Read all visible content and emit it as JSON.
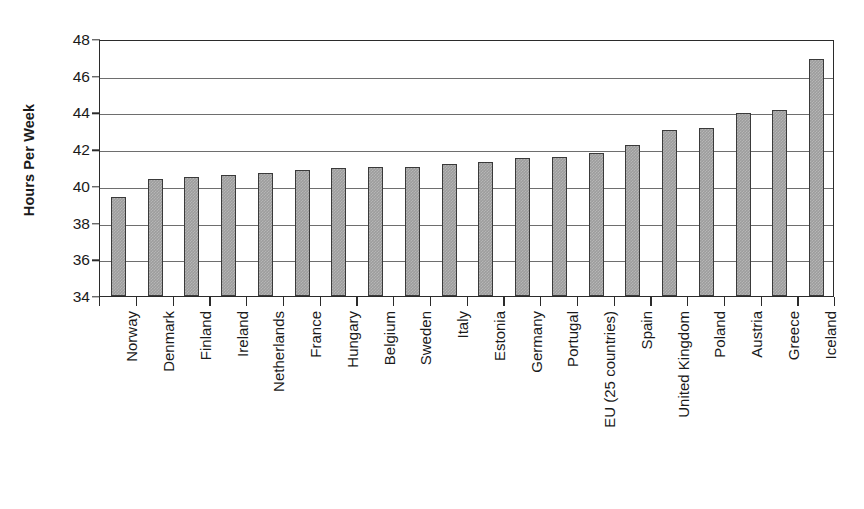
{
  "chart_data": {
    "type": "bar",
    "title": "",
    "subtitle": "",
    "xlabel": "",
    "ylabel": "Hours Per Week",
    "ylim": [
      34,
      48
    ],
    "ytick_step": 2,
    "yticks": [
      34,
      36,
      38,
      40,
      42,
      44,
      46,
      48
    ],
    "grid": true,
    "legend": false,
    "legend_position": "none",
    "orientation": "vertical",
    "bar_color": "#9d9d9d",
    "bar_border_color": "#3a3a3a",
    "gridline_color": "#6e6e6e",
    "axis_color": "#2b2b2b",
    "background": "#ffffff",
    "categories": [
      "Norway",
      "Denmark",
      "Finland",
      "Ireland",
      "Netherlands",
      "France",
      "Hungary",
      "Belgium",
      "Sweden",
      "Italy",
      "Estonia",
      "Germany",
      "Portugal",
      "EU (25 countries)",
      "Spain",
      "United Kingdom",
      "Poland",
      "Austria",
      "Greece",
      "Iceland"
    ],
    "values": [
      39.4,
      40.4,
      40.5,
      40.6,
      40.7,
      40.85,
      40.95,
      41.05,
      41.05,
      41.2,
      41.3,
      41.5,
      41.6,
      41.8,
      42.25,
      43.05,
      43.15,
      43.95,
      44.15,
      46.9
    ],
    "value_unit": "hours per week"
  }
}
